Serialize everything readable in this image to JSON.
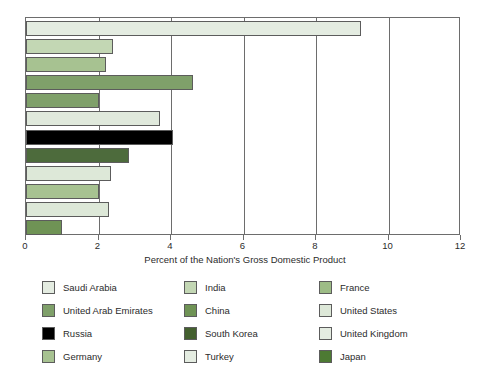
{
  "chart_data": {
    "type": "bar",
    "orientation": "horizontal",
    "title": "",
    "subtitle": "",
    "xlabel": "Percent of the Nation's Gross Domestic Product",
    "ylabel": "",
    "xlim": [
      0,
      12
    ],
    "xticks": [
      0,
      2,
      4,
      6,
      8,
      10,
      12
    ],
    "xtick_labels": [
      "0",
      "2",
      "4",
      "6",
      "8",
      "10",
      "12"
    ],
    "grid": true,
    "grid_axis": "x",
    "legend_position": "below",
    "legend_columns": 3,
    "legend_order": "down-columns",
    "categories": [
      "Saudi Arabia",
      "United Arab Emirates",
      "France",
      "China",
      "Germany",
      "United States",
      "Russia",
      "South Korea",
      "United Kingdom",
      "India",
      "Turkey",
      "Japan"
    ],
    "values": [
      9.25,
      2.4,
      2.2,
      4.6,
      2.0,
      3.7,
      4.05,
      2.85,
      2.35,
      2.0,
      2.3,
      1.0
    ],
    "bars": [
      {
        "label": "Saudi Arabia",
        "value": 9.25,
        "color": "#e4ece1"
      },
      {
        "label": "United Arab Emirates",
        "value": 2.4,
        "color": "#c3d7b4"
      },
      {
        "label": "France",
        "value": 2.2,
        "color": "#a7c291"
      },
      {
        "label": "China",
        "value": 4.6,
        "color": "#7fa06a"
      },
      {
        "label": "Germany",
        "value": 2.0,
        "color": "#7fa06a"
      },
      {
        "label": "United States",
        "value": 3.7,
        "color": "#e0e9dc"
      },
      {
        "label": "Russia",
        "value": 4.05,
        "color": "#000000"
      },
      {
        "label": "South Korea",
        "value": 2.85,
        "color": "#4d6b3c"
      },
      {
        "label": "United Kingdom",
        "value": 2.35,
        "color": "#dde8d8"
      },
      {
        "label": "India",
        "value": 2.0,
        "color": "#a7c291"
      },
      {
        "label": "Turkey",
        "value": 2.3,
        "color": "#dde8d8"
      },
      {
        "label": "Japan",
        "value": 1.0,
        "color": "#6f9355"
      }
    ]
  },
  "legend": {
    "columns": [
      {
        "entries": [
          {
            "label": "Saudi Arabia",
            "color": "#e4ece1"
          },
          {
            "label": "United Arab Emirates",
            "color": "#7fa06a"
          },
          {
            "label": "Russia",
            "color": "#000000"
          },
          {
            "label": "Germany",
            "color": "#a7c291"
          }
        ]
      },
      {
        "entries": [
          {
            "label": "India",
            "color": "#c3d7b4"
          },
          {
            "label": "China",
            "color": "#6f9355"
          },
          {
            "label": "South Korea",
            "color": "#44602f"
          },
          {
            "label": "Turkey",
            "color": "#e4ece1"
          }
        ]
      },
      {
        "entries": [
          {
            "label": "France",
            "color": "#9dbc86"
          },
          {
            "label": "United States",
            "color": "#dde8d8"
          },
          {
            "label": "United Kingdom",
            "color": "#e4ece1"
          },
          {
            "label": "Japan",
            "color": "#4d7a33"
          }
        ]
      }
    ]
  },
  "axis": {
    "title": "Percent of the Nation's Gross Domestic Product"
  },
  "colors": {
    "frame": "#6d6d6d",
    "gridline": "#6d6d6d",
    "bar_outline": "#5c5c5c",
    "text": "#2b2b2b",
    "background": "#ffffff"
  }
}
